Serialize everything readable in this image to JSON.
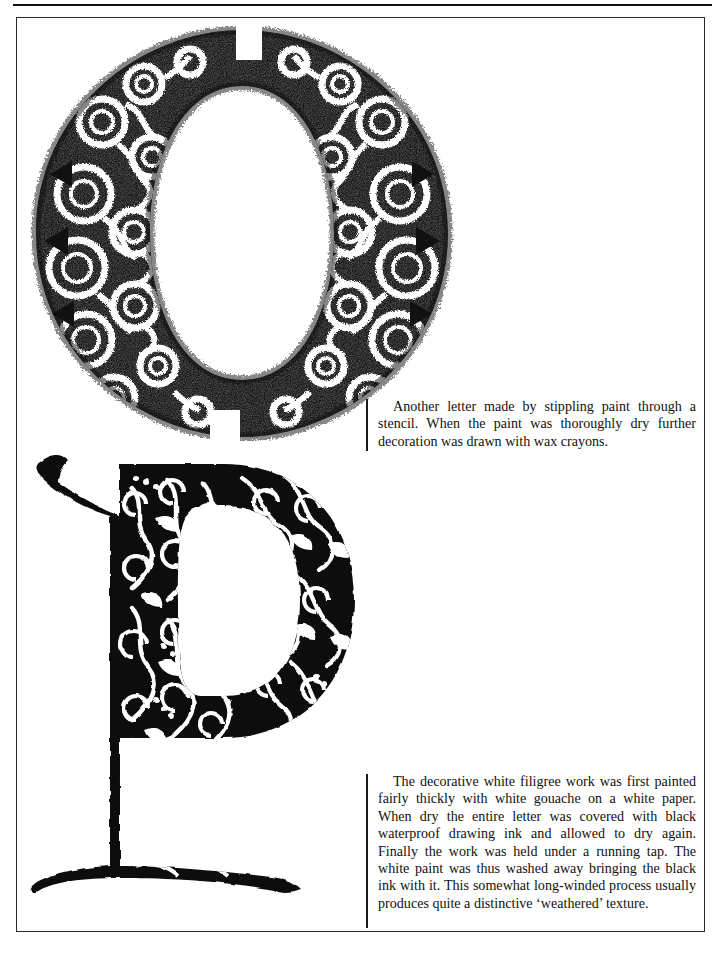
{
  "page": {
    "width": 727,
    "height": 953,
    "background_color": "#ffffff",
    "ink_color": "#111111",
    "frame_color": "#2a2a2a"
  },
  "figures": [
    {
      "id": "letter-o",
      "glyph": "O",
      "case": "uppercase",
      "technique": "stippled paint through a stencil with wax-crayon decoration",
      "motif": "concentric rings and spiral scroll curls",
      "ink": "#111111",
      "ground": "#ffffff"
    },
    {
      "id": "letter-p",
      "glyph": "p",
      "case": "lowercase",
      "technique": "white gouache under black waterproof ink, washed away",
      "motif": "white filigree scrollwork with dotted tendrils",
      "ink": "#111111",
      "ground": "#ffffff"
    }
  ],
  "captions": {
    "letter_o": "Another letter made by stippling paint through a stencil. When the paint was thoroughly dry further decoration was drawn with wax crayons.",
    "letter_p": "The decorative white filigree work was first painted fairly thickly with white gouache on a white paper. When dry the entire letter was covered with black waterproof drawing ink and allowed to dry again. Finally the work was held under a running tap. The white paint was thus washed away bringing the black ink with it. This somewhat long-winded process usually produces quite a distinctive ‘weathered’ texture."
  }
}
